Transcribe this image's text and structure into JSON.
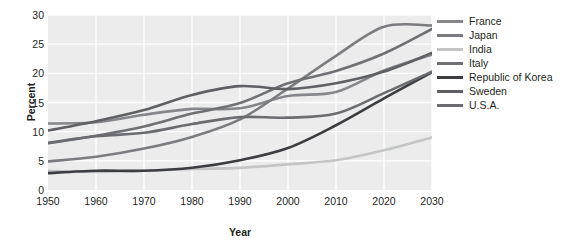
{
  "chart_data": {
    "type": "line",
    "title": "",
    "xlabel": "Year",
    "ylabel": "Percent",
    "xlim": [
      1950,
      2030
    ],
    "ylim": [
      0,
      30
    ],
    "grid": true,
    "legend_position": "right",
    "x": [
      1950,
      1960,
      1970,
      1980,
      1990,
      2000,
      2010,
      2020,
      2030
    ],
    "xtick_labels": [
      "1950",
      "1960",
      "1970",
      "1980",
      "1990",
      "2000",
      "2010",
      "2020",
      "2030"
    ],
    "ytick_labels": [
      "0",
      "5",
      "10",
      "15",
      "20",
      "25",
      "30"
    ],
    "ytick_values": [
      0,
      5,
      10,
      15,
      20,
      25,
      30
    ],
    "series": [
      {
        "name": "France",
        "color": "#85878a",
        "values": [
          11.4,
          11.6,
          12.9,
          13.9,
          14.0,
          16.1,
          16.8,
          20.5,
          23.2
        ]
      },
      {
        "name": "Japan",
        "color": "#7a7c7f",
        "values": [
          4.9,
          5.7,
          7.1,
          9.1,
          12.1,
          17.4,
          23.0,
          28.0,
          28.2
        ]
      },
      {
        "name": "India",
        "color": "#c3c5c7",
        "values": [
          3.3,
          3.1,
          3.3,
          3.6,
          3.8,
          4.4,
          5.1,
          6.8,
          9.0
        ]
      },
      {
        "name": "Italy",
        "color": "#6e7074",
        "values": [
          8.0,
          9.3,
          10.9,
          13.1,
          14.9,
          18.3,
          20.4,
          23.4,
          27.6
        ]
      },
      {
        "name": "Republic of Korea",
        "color": "#3b3d40",
        "values": [
          2.9,
          3.3,
          3.3,
          3.8,
          5.1,
          7.2,
          11.1,
          15.7,
          20.2
        ]
      },
      {
        "name": "Sweden",
        "color": "#5e6063",
        "values": [
          10.2,
          11.8,
          13.7,
          16.3,
          17.8,
          17.3,
          18.3,
          20.3,
          23.5
        ]
      },
      {
        "name": "U.S.A.",
        "color": "#6a6c6f",
        "values": [
          8.1,
          9.2,
          9.8,
          11.3,
          12.5,
          12.4,
          13.1,
          16.6,
          20.3
        ]
      }
    ]
  },
  "legend": {
    "items": [
      {
        "label": "France"
      },
      {
        "label": "Japan"
      },
      {
        "label": "India"
      },
      {
        "label": "Italy"
      },
      {
        "label": "Republic of Korea"
      },
      {
        "label": "Sweden"
      },
      {
        "label": "U.S.A."
      }
    ]
  },
  "colors": {
    "plot_background": "#ececec",
    "gridline": "#ffffff",
    "text": "#231f20",
    "page_background": "#ffffff"
  }
}
